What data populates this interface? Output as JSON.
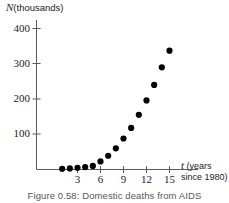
{
  "figure": {
    "caption_prefix": "Figure 0.58:",
    "caption_text": "Domestic deaths from AIDS",
    "caption_full": "Figure 0.58: Domestic deaths from AIDS"
  },
  "axes": {
    "y_variable": "N",
    "y_units": "(thousands)",
    "y_label_full": "N (thousands)",
    "x_variable": "t",
    "x_units_line1": "(years",
    "x_units_line2": "since 1980)",
    "x_label_full": "t (years since 1980)",
    "y_ticks": [
      "100",
      "200",
      "300",
      "400"
    ],
    "x_ticks": [
      "3",
      "6",
      "9",
      "12",
      "15"
    ]
  },
  "colors": {
    "marker": "#000000",
    "axis": "#444444",
    "text": "#1a1a1a",
    "caption": "#555555",
    "background": "#ffffff"
  },
  "chart_data": {
    "type": "scatter",
    "title": "Figure 0.58: Domestic deaths from AIDS",
    "xlabel": "t (years since 1980)",
    "ylabel": "N (thousands)",
    "xlim": [
      0,
      16.5
    ],
    "ylim": [
      0,
      430
    ],
    "grid": false,
    "legend": null,
    "x_ticks": [
      3,
      6,
      9,
      12,
      15
    ],
    "y_ticks": [
      100,
      200,
      300,
      400
    ],
    "series": [
      {
        "name": "Cumulative AIDS deaths",
        "x": [
          1,
          2,
          3,
          4,
          5,
          6,
          7,
          8,
          9,
          10,
          11,
          12,
          13,
          14,
          15
        ],
        "y": [
          2,
          3,
          5,
          7,
          10,
          23,
          39,
          60,
          88,
          118,
          155,
          196,
          240,
          290,
          337
        ]
      }
    ]
  }
}
